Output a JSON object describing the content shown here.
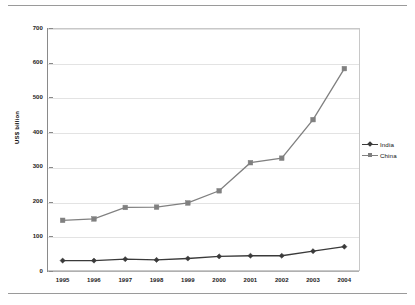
{
  "chart_data": {
    "type": "line",
    "title": "",
    "xlabel": "",
    "ylabel": "US$ billion",
    "categories": [
      "1995",
      "1996",
      "1997",
      "1998",
      "1999",
      "2000",
      "2001",
      "2002",
      "2003",
      "2004"
    ],
    "x": [
      1995,
      1996,
      1997,
      1998,
      1999,
      2000,
      2001,
      2002,
      2003,
      2004
    ],
    "series": [
      {
        "name": "India",
        "color": "#3a3a3a",
        "marker": "diamond",
        "values": [
          30,
          30,
          34,
          32,
          36,
          42,
          44,
          44,
          57,
          70
        ]
      },
      {
        "name": "China",
        "color": "#808080",
        "marker": "square",
        "values": [
          146,
          150,
          183,
          184,
          196,
          231,
          312,
          325,
          436,
          583
        ]
      }
    ],
    "ylim": [
      0,
      700
    ],
    "yticks": [
      0,
      100,
      200,
      300,
      400,
      500,
      600,
      700
    ],
    "ytick_labels": [
      "0",
      "100",
      "200",
      "300",
      "400",
      "500",
      "600",
      "700"
    ],
    "grid": true,
    "grid_axis": "y",
    "legend_position": "right"
  },
  "legend": {
    "entries": [
      {
        "label": "India"
      },
      {
        "label": "China"
      }
    ]
  },
  "axis": {
    "y_title": "US$ billion"
  },
  "colors": {
    "india": "#3a3a3a",
    "china": "#808080",
    "gridline": "#e3e3e3",
    "axis": "#8a8a8a",
    "rule": "#9a9a9a"
  }
}
